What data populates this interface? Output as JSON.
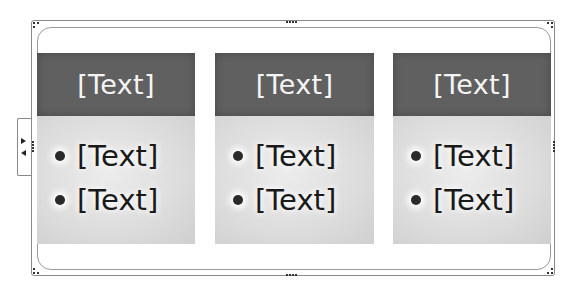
{
  "diagram": {
    "type": "smartart-horizontal-bullet-list",
    "selected": true,
    "columns": [
      {
        "header": "[Text]",
        "bullets": [
          "[Text]",
          "[Text]"
        ]
      },
      {
        "header": "[Text]",
        "bullets": [
          "[Text]",
          "[Text]"
        ]
      },
      {
        "header": "[Text]",
        "bullets": [
          "[Text]",
          "[Text]"
        ]
      }
    ]
  },
  "colors": {
    "header_fill": "#606060",
    "header_text": "#f4f4f4",
    "body_fill": "#d9d9d9",
    "body_text": "#1a1a1a",
    "frame_border": "#8a8a8a"
  },
  "icons": {
    "text_pane_toggle": "expand-collapse-arrows-icon",
    "resize_handle": "dotted-grip-icon"
  }
}
